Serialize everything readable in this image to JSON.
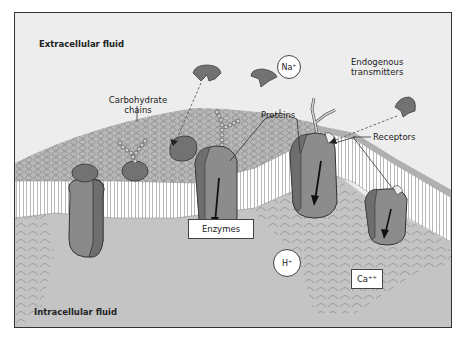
{
  "figure": {
    "regions": {
      "extracellular": "Extracellular fluid",
      "intracellular": "Intracellular fluid"
    },
    "labels": {
      "carbohydrate_chains": "Carbohydrate\nchains",
      "carbohydrate_line1": "Carbohydrate",
      "carbohydrate_line2": "chains",
      "proteins": "Proteins",
      "receptors": "Receptors",
      "endogenous_line1": "Endogenous",
      "endogenous_line2": "transmitters",
      "enzymes": "Enzymes"
    },
    "ions": {
      "sodium": "Na⁺",
      "hydrogen": "H⁺",
      "calcium": "Ca⁺⁺"
    },
    "colors": {
      "background": "#ededed",
      "intracellular": "#c4c4c4",
      "membrane_surface": "#b5b5b5",
      "protein_dark": "#6f6f6f",
      "protein_mid": "#8c8c8c",
      "lipid_tail": "#ffffff",
      "outline": "#333333"
    }
  }
}
